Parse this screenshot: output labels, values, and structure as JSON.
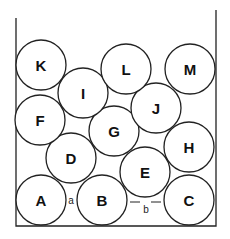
{
  "diagram": {
    "type": "sphere-packing-in-container",
    "container": {
      "left": 16,
      "right": 216,
      "top": 18,
      "bottom": 226
    },
    "radius": 25,
    "balls": [
      {
        "id": "A",
        "cx": 41,
        "cy": 200
      },
      {
        "id": "B",
        "cx": 102,
        "cy": 200
      },
      {
        "id": "C",
        "cx": 189,
        "cy": 200
      },
      {
        "id": "D",
        "cx": 71,
        "cy": 158
      },
      {
        "id": "E",
        "cx": 145,
        "cy": 172
      },
      {
        "id": "F",
        "cx": 40,
        "cy": 120
      },
      {
        "id": "G",
        "cx": 114,
        "cy": 131
      },
      {
        "id": "H",
        "cx": 189,
        "cy": 147
      },
      {
        "id": "I",
        "cx": 83,
        "cy": 93
      },
      {
        "id": "J",
        "cx": 156,
        "cy": 108
      },
      {
        "id": "K",
        "cx": 41,
        "cy": 65
      },
      {
        "id": "L",
        "cx": 126,
        "cy": 69
      },
      {
        "id": "M",
        "cx": 190,
        "cy": 69
      }
    ],
    "gap_labels": [
      {
        "id": "a",
        "text": "a",
        "x": 71,
        "y": 200
      },
      {
        "id": "b",
        "text": "b",
        "x": 146,
        "y": 209
      }
    ]
  }
}
